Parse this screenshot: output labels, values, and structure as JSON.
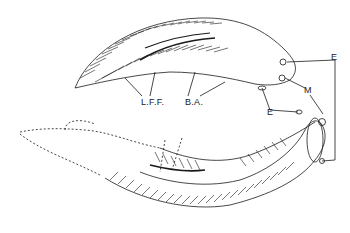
{
  "figure": {
    "labels": {
      "lff": "L.F.F.",
      "ba": "B.A.",
      "e_right": "E",
      "m": "M",
      "e_lower": "E"
    },
    "colors": {
      "ink": "#1a1a1a",
      "background": "#ffffff"
    }
  }
}
